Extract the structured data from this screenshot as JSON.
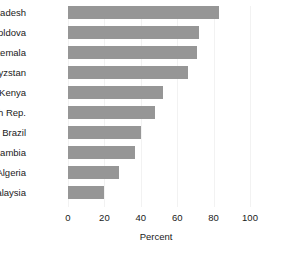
{
  "chart_data": {
    "type": "bar",
    "orientation": "horizontal",
    "title": "",
    "subtitle": "",
    "xlabel": "Percent",
    "ylabel": "",
    "xlim": [
      0,
      100
    ],
    "xticks": [
      0,
      20,
      40,
      60,
      80,
      100
    ],
    "xtick_labels": [
      "0",
      "20",
      "40",
      "60",
      "80",
      "100"
    ],
    "grid": true,
    "grid_axis": "x",
    "legend": null,
    "legend_position": "none",
    "bar_color": "#969696",
    "background_color": "#ffffff",
    "text_color": "#1a1a1a",
    "categories": [
      "Bangladesh",
      "Moldova",
      "Guatemala",
      "Kyrgyzstan",
      "Kenya",
      "Czech Rep.",
      "Brazil",
      "Zambia",
      "Algeria",
      "Malaysia"
    ],
    "values": [
      83,
      72,
      71,
      66,
      52,
      48,
      40,
      37,
      28,
      20
    ]
  }
}
